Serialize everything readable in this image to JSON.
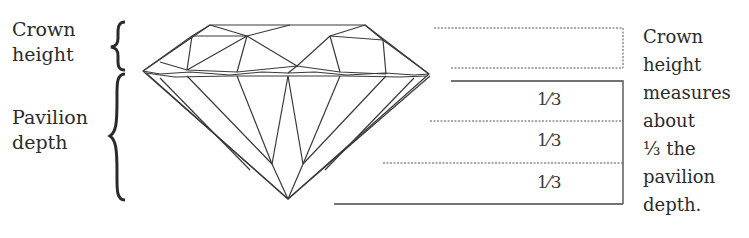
{
  "left_labels": {
    "crown_line1": "Crown",
    "crown_line2": "height",
    "pavilion_line1": "Pavilion",
    "pavilion_line2": "depth"
  },
  "fractions": [
    "1⁄3",
    "1⁄3",
    "1⁄3"
  ],
  "right_note": {
    "lines": [
      "Crown",
      "height",
      "measures",
      "about",
      "⅓ the",
      "pavilion",
      "depth."
    ]
  },
  "colors": {
    "line": "#3a3a3a",
    "text": "#2b2b2b",
    "background": "#ffffff"
  }
}
